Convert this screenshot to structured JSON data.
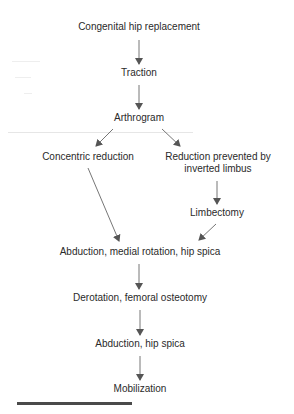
{
  "diagram": {
    "type": "flowchart",
    "direction": "top-to-bottom",
    "nodes": {
      "congenital": "Congenital hip replacement",
      "traction": "Traction",
      "arthrogram": "Arthrogram",
      "concentric": "Concentric reduction",
      "prevented_line1": "Reduction prevented by",
      "prevented_line2": "inverted limbus",
      "limbectomy": "Limbectomy",
      "abduction_medial": "Abduction, medial rotation, hip spica",
      "derotation": "Derotation, femoral osteotomy",
      "abduction_spica": "Abduction, hip spica",
      "mobilization": "Mobilization"
    },
    "edges": [
      [
        "Congenital hip replacement",
        "Traction"
      ],
      [
        "Traction",
        "Arthrogram"
      ],
      [
        "Arthrogram",
        "Concentric reduction"
      ],
      [
        "Arthrogram",
        "Reduction prevented by inverted limbus"
      ],
      [
        "Reduction prevented by inverted limbus",
        "Limbectomy"
      ],
      [
        "Concentric reduction",
        "Abduction, medial rotation, hip spica"
      ],
      [
        "Limbectomy",
        "Abduction, medial rotation, hip spica"
      ],
      [
        "Abduction, medial rotation, hip spica",
        "Derotation, femoral osteotomy"
      ],
      [
        "Derotation, femoral osteotomy",
        "Abduction, hip spica"
      ],
      [
        "Abduction, hip spica",
        "Mobilization"
      ]
    ],
    "colors": {
      "text": "#2a2a2a",
      "arrow": "#555555",
      "bar": "#4a4a4a",
      "background": "#ffffff"
    }
  }
}
